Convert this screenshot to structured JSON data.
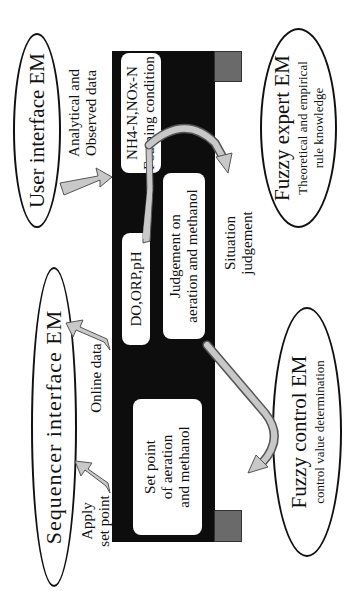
{
  "diagram": {
    "orientation": "rotated -90deg (text reads bottom-to-top)",
    "nodes": {
      "user_interface": {
        "title": "User interface EM"
      },
      "sequencer_interface": {
        "title": "Sequencer interface EM"
      },
      "fuzzy_expert": {
        "title": "Fuzzy expert EM",
        "subtitle_line1": "Theoretical and empirical",
        "subtitle_line2": "rule knowledge"
      },
      "fuzzy_control": {
        "title": "Fuzzy control EM",
        "subtitle": "control value determination"
      }
    },
    "boxes": {
      "analytical": {
        "line1": "NH4-N,NOx-N",
        "line2": "Foaming condition"
      },
      "online": {
        "line1": "DO,ORP,pH"
      },
      "judgement": {
        "line1": "Judgement on",
        "line2": "aeration and methanol"
      },
      "set_point": {
        "line1": "Set point",
        "line2": "of aeration",
        "line3": "and methanol"
      }
    },
    "edge_labels": {
      "analytical_data": {
        "line1": "Analytical and",
        "line2": "Observed data"
      },
      "online_data": {
        "line1": "Online data"
      },
      "apply_set_point": {
        "line1": "Apply",
        "line2": "set point"
      },
      "situation_judgement": {
        "line1": "Situation",
        "line2": "judgement"
      }
    },
    "colors": {
      "bar": "#0d0d0d",
      "tab": "#6a6a6a",
      "arrow_fill": "#c8c8c8",
      "arrow_stroke": "#555555",
      "ellipse_stroke": "#111111"
    }
  }
}
